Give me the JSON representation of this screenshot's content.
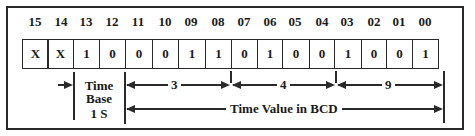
{
  "diagram": {
    "bit_numbers": [
      "15",
      "14",
      "13",
      "12",
      "11",
      "10",
      "09",
      "08",
      "07",
      "06",
      "05",
      "04",
      "03",
      "02",
      "01",
      "00"
    ],
    "bit_values": [
      "X",
      "X",
      "1",
      "0",
      "0",
      "0",
      "1",
      "1",
      "0",
      "1",
      "0",
      "0",
      "1",
      "0",
      "0",
      "1"
    ],
    "time_base": {
      "line1": "Time",
      "line2": "Base",
      "line3": "1 S"
    },
    "bcd_digits": [
      "3",
      "4",
      "9"
    ],
    "time_value_label": "Time Value in BCD"
  }
}
